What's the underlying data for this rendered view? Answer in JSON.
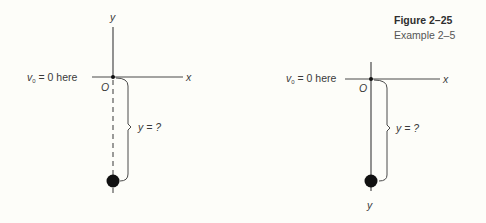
{
  "caption": {
    "figure_label": "Figure 2–25",
    "subtitle": "Example 2–5"
  },
  "left_diagram": {
    "axis_y_label": "y",
    "axis_x_label": "x",
    "origin_label": "O",
    "initial_condition_prefix": "v",
    "initial_condition_subscript": "0",
    "initial_condition_suffix": " = 0 here",
    "distance_label": "y = ?",
    "trajectory_style": "dashed"
  },
  "right_diagram": {
    "axis_y_label": "y",
    "axis_x_label": "x",
    "origin_label": "O",
    "initial_condition_prefix": "v",
    "initial_condition_subscript": "0",
    "initial_condition_suffix": " = 0 here",
    "distance_label": "y = ?",
    "trajectory_style": "solid"
  },
  "colors": {
    "background": "#fdfdf9",
    "line": "#4a4a4a",
    "ball": "#111111",
    "text": "#3a3a3a"
  }
}
